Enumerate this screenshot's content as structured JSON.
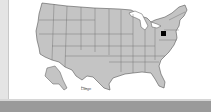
{
  "map": {
    "title": "United States",
    "fill_color": "#c4c4c4",
    "stroke_color": "#555555",
    "marker": {
      "label": "selected location",
      "color": "#000000",
      "x": 154,
      "y": 33
    },
    "scale_label": "Large"
  },
  "colors": {
    "panel": "#ffffff",
    "background": "#e4e4e4",
    "bottom_bar": "#9a9a9a"
  }
}
